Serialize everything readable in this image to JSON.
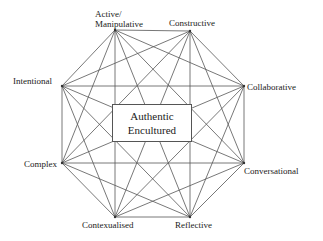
{
  "diagram": {
    "center": {
      "line1": "Authentic",
      "line2": "Encultured"
    },
    "nodes": [
      {
        "id": "active",
        "line1": "Active/",
        "line2": "Manipulative",
        "x": 115,
        "y": 30
      },
      {
        "id": "constructive",
        "label": "Constructive",
        "x": 190,
        "y": 31
      },
      {
        "id": "collaborative",
        "label": "Collaborative",
        "x": 244,
        "y": 86
      },
      {
        "id": "conversational",
        "label": "Conversational",
        "x": 244,
        "y": 163
      },
      {
        "id": "reflective",
        "label": "Reflective",
        "x": 190,
        "y": 217
      },
      {
        "id": "contexualised",
        "label": "Contexualised",
        "x": 115,
        "y": 217
      },
      {
        "id": "complex",
        "label": "Complex",
        "x": 62,
        "y": 163
      },
      {
        "id": "intentional",
        "label": "Intentional",
        "x": 62,
        "y": 86
      }
    ],
    "edges": "complete graph connecting all 8 nodes",
    "line_color": "#555555"
  }
}
